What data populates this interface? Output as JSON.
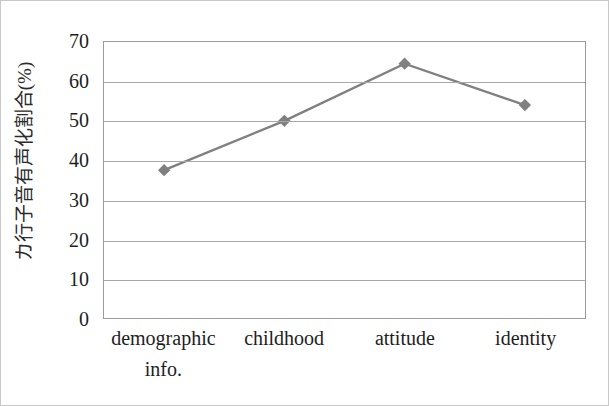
{
  "chart_data": {
    "type": "line",
    "title": "",
    "subtitle": "",
    "xlabel": "",
    "ylabel": "カ行子音有声化割合(%)",
    "categories": [
      "demographic info.",
      "childhood",
      "attitude",
      "identity"
    ],
    "category_lines": [
      [
        "demographic",
        "info."
      ],
      [
        "childhood"
      ],
      [
        "attitude"
      ],
      [
        "identity"
      ]
    ],
    "values": [
      37.5,
      50,
      64.5,
      54
    ],
    "series": [
      {
        "name": "カ行子音有声化割合",
        "values": [
          37.5,
          50,
          64.5,
          54
        ]
      }
    ],
    "ylim": [
      0,
      70
    ],
    "yticks": [
      0,
      10,
      20,
      30,
      40,
      50,
      60,
      70
    ],
    "ytick_labels": [
      "0",
      "10",
      "20",
      "30",
      "40",
      "50",
      "60",
      "70"
    ],
    "grid": "horizontal",
    "legend": "none",
    "marker": "diamond",
    "line_color": "#808080",
    "marker_color": "#808080",
    "grid_color": "#a8a8a8",
    "frame_color": "#9c9c9c",
    "background_color": "#ffffff",
    "text_color": "#1e1e1e",
    "annotations": []
  }
}
